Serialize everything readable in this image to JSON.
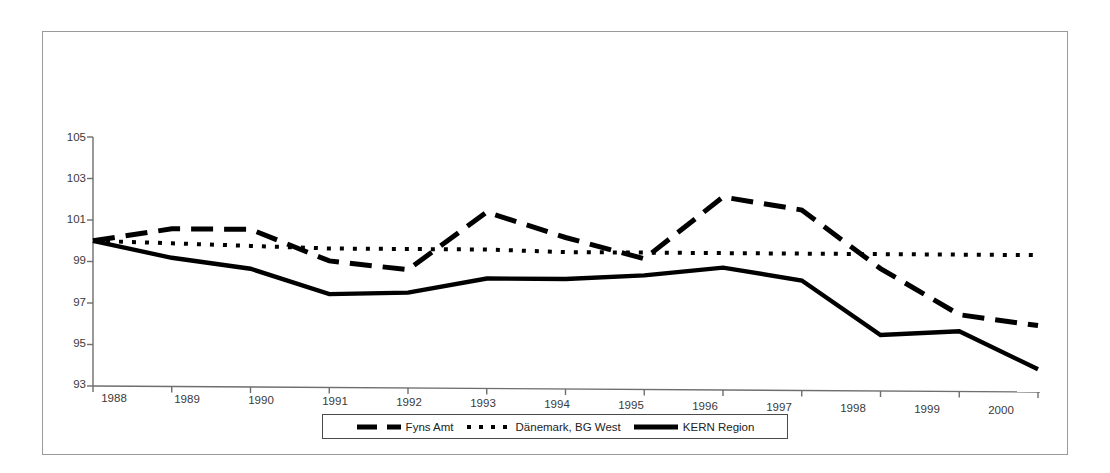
{
  "chart_data": {
    "type": "line",
    "title": "",
    "subtitle": "",
    "xlabel": "",
    "ylabel": "",
    "x": [
      1988,
      1989,
      1990,
      1991,
      1992,
      1993,
      1994,
      1995,
      1996,
      1997,
      1998,
      1999,
      2000
    ],
    "categories": [
      "1988",
      "1989",
      "1990",
      "1991",
      "1992",
      "1993",
      "1994",
      "1995",
      "1996",
      "1997",
      "1998",
      "1999",
      "2000"
    ],
    "xlim": [
      1988,
      2000
    ],
    "ylim": [
      93,
      105
    ],
    "yticks": [
      93,
      95,
      97,
      99,
      101,
      103,
      105
    ],
    "ytick_labels": [
      "93",
      "95",
      "97",
      "99",
      "101",
      "103",
      "105"
    ],
    "grid": false,
    "legend_position": "bottom",
    "series": [
      {
        "name": "Fyns Amt",
        "style": "dashed",
        "color": "#000000",
        "values": [
          100.0,
          100.6,
          100.6,
          99.1,
          98.7,
          101.5,
          100.3,
          99.3,
          102.3,
          101.7,
          98.9,
          96.7,
          96.2
        ]
      },
      {
        "name": "Dänemark, BG West",
        "style": "dotted",
        "color": "#000000",
        "values": [
          100.0,
          99.9,
          99.8,
          99.7,
          99.7,
          99.7,
          99.6,
          99.6,
          99.6,
          99.6,
          99.6,
          99.6,
          99.6
        ]
      },
      {
        "name": "KERN Region",
        "style": "solid",
        "color": "#000000",
        "values": [
          100.0,
          99.2,
          98.7,
          97.5,
          97.6,
          98.3,
          98.3,
          98.5,
          98.9,
          98.3,
          95.7,
          95.9,
          94.1
        ]
      }
    ]
  },
  "legend": {
    "items": [
      {
        "label": "Fyns Amt",
        "style": "dashed"
      },
      {
        "label": "Dänemark, BG West",
        "style": "dotted"
      },
      {
        "label": "KERN Region",
        "style": "solid"
      }
    ]
  },
  "axes": {
    "y_tick_labels": [
      "105",
      "103",
      "101",
      "99",
      "97",
      "95",
      "93"
    ],
    "x_tick_labels": [
      "1988",
      "1989",
      "1990",
      "1991",
      "1992",
      "1993",
      "1994",
      "1995",
      "1996",
      "1997",
      "1998",
      "1999",
      "2000"
    ]
  },
  "colors": {
    "frame": "#9a9a9a",
    "axis": "#6e6e6e",
    "series": "#000000",
    "text": "#3a3a3a",
    "background": "#ffffff"
  }
}
